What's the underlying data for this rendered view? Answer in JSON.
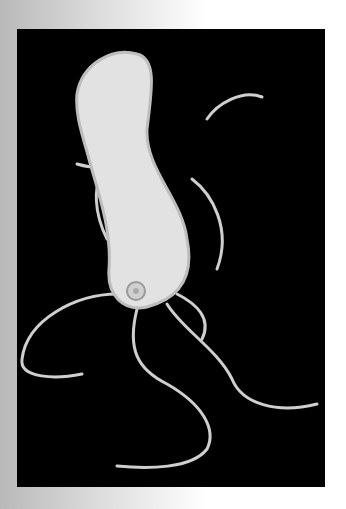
{
  "image": {
    "subject": "micrograph-bacterium-with-flagella",
    "background_colors": {
      "left": "#b8b8b8",
      "right": "#ffffff"
    },
    "panel_color": "#000000",
    "cell_color": "#e2e2e2",
    "outline_color": "#bdbdbd"
  }
}
